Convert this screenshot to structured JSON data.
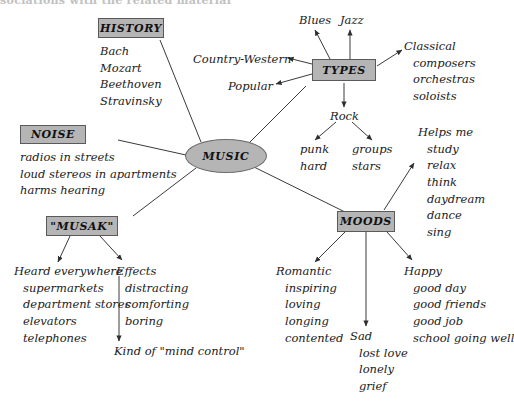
{
  "title_fragment": "sociations with the related material",
  "colors": {
    "node_fill": "#b5b5b5",
    "node_border": "#5a5a5a",
    "text": "#1b1b1b",
    "line": "#3a3a3a"
  },
  "center": {
    "label": "MUSIC"
  },
  "nodes": {
    "history": {
      "label": "HISTORY"
    },
    "noise": {
      "label": "NOISE"
    },
    "musak": {
      "label": "\"MUSAK\""
    },
    "types": {
      "label": "TYPES"
    },
    "moods": {
      "label": "MOODS"
    }
  },
  "history_items": [
    "Bach",
    "Mozart",
    "Beethoven",
    "Stravinsky"
  ],
  "noise_items": [
    "radios in streets",
    "loud stereos in apartments",
    "harms hearing"
  ],
  "musak": {
    "heard_head": "Heard everywhere",
    "heard_items": [
      "supermarkets",
      "department stores",
      "elevators",
      "telephones"
    ],
    "effects_head": "Effects",
    "effects_items": [
      "distracting",
      "comforting",
      "boring"
    ],
    "conclusion": "Kind of \"mind control\""
  },
  "types": {
    "blues": "Blues",
    "jazz": "Jazz",
    "country_western": "Country-Western",
    "popular": "Popular",
    "classical_head": "Classical",
    "classical_items": [
      "composers",
      "orchestras",
      "soloists"
    ],
    "rock_head": "Rock",
    "rock_left": [
      "punk",
      "hard"
    ],
    "rock_right": [
      "groups",
      "stars"
    ]
  },
  "moods": {
    "helps_head": "Helps me",
    "helps_items": [
      "study",
      "relax",
      "think",
      "daydream",
      "dance",
      "sing"
    ],
    "romantic_head": "Romantic",
    "romantic_items": [
      "inspiring",
      "loving",
      "longing",
      "contented"
    ],
    "sad_head": "Sad",
    "sad_items": [
      "lost love",
      "lonely",
      "grief"
    ],
    "happy_head": "Happy",
    "happy_items": [
      "good day",
      "good friends",
      "good job",
      "school going well"
    ]
  }
}
